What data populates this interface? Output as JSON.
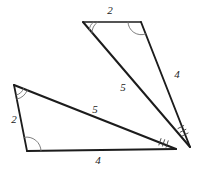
{
  "figure": {
    "canvas": {
      "width": 198,
      "height": 172,
      "background": "#ffffff"
    },
    "stroke_color": "#1c1c1c",
    "arc_color": "#6f6f6f",
    "tick_color": "#3a3a3a",
    "label_color": "#1a1a1a"
  },
  "upper_triangle": {
    "name": "upper-triangle",
    "vertices": {
      "top_left": {
        "x": 83,
        "y": 22
      },
      "top_right": {
        "x": 141,
        "y": 22
      },
      "bottom": {
        "x": 190,
        "y": 147
      }
    },
    "edges": [
      {
        "name": "top-edge",
        "label": "2",
        "label_x": 110,
        "label_y": 11
      },
      {
        "name": "right-edge",
        "label": "4",
        "label_x": 177,
        "label_y": 75
      },
      {
        "name": "hypotenuse-edge",
        "label": "5",
        "label_x": 123,
        "label_y": 88
      }
    ],
    "angle_marks": {
      "top_left": "double-arc",
      "top_right": "single-arc",
      "bottom": "tick-marks"
    }
  },
  "lower_triangle": {
    "name": "lower-triangle",
    "vertices": {
      "top_left": {
        "x": 14,
        "y": 85
      },
      "bottom_left": {
        "x": 27,
        "y": 151
      },
      "right": {
        "x": 176,
        "y": 149
      }
    },
    "edges": [
      {
        "name": "left-edge",
        "label": "2",
        "label_x": 14,
        "label_y": 120
      },
      {
        "name": "bottom-edge",
        "label": "4",
        "label_x": 98,
        "label_y": 161
      },
      {
        "name": "hypotenuse-edge",
        "label": "5",
        "label_x": 95,
        "label_y": 110
      }
    ],
    "angle_marks": {
      "top_left": "double-arc",
      "bottom_left": "single-arc",
      "right": "tick-marks"
    }
  }
}
